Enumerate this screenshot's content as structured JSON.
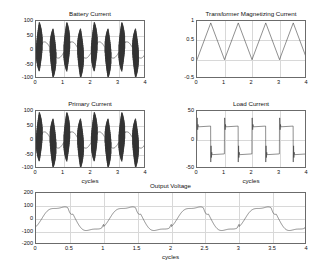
{
  "figure": {
    "background": "#ffffff",
    "line_color": "#333333",
    "grid_color": "#d8d8d8",
    "axis_color": "#6b6b6b"
  },
  "chart_data": [
    {
      "id": "battery-current",
      "type": "line",
      "title": "Battery Current",
      "xlabel": "",
      "ylabel": "",
      "xlim": [
        0,
        4
      ],
      "ylim": [
        -100,
        100
      ],
      "xticks": [
        0,
        1,
        2,
        3,
        4
      ],
      "xticklabels": [
        "0",
        "1",
        "2",
        "3",
        "4"
      ],
      "yticks": [
        -100,
        -50,
        0,
        50,
        100
      ],
      "yticklabels": [
        "-100",
        "-50",
        "0",
        "50",
        "100"
      ],
      "grid": true,
      "description": "High-frequency switching current bursts riding on a slow sinusoidal envelope; eight spike clusters across 4 cycles, spikes reach about +95 and -95.",
      "envelope_period_cycles": 0.5,
      "spike_peak": 95,
      "spike_min": -95,
      "series": [
        {
          "name": "Battery Current",
          "envelope_amplitude": 28,
          "burst_centers": [
            0.12,
            0.62,
            1.12,
            1.62,
            2.12,
            2.62,
            3.12,
            3.62
          ]
        }
      ]
    },
    {
      "id": "transformer-magnetizing-current",
      "type": "line",
      "title": "Transformer Magnetizing Current",
      "xlabel": "",
      "ylabel": "",
      "xlim": [
        0,
        4
      ],
      "ylim": [
        -0.5,
        1
      ],
      "xticks": [
        0,
        1,
        2,
        3,
        4
      ],
      "xticklabels": [
        "0",
        "1",
        "2",
        "3",
        "4"
      ],
      "yticks": [
        -0.5,
        0,
        0.5,
        1
      ],
      "yticklabels": [
        "-0.5",
        "0",
        "0.5",
        "1"
      ],
      "grid": true,
      "description": "Triangular magnetizing current ramping from 0 up to about 0.95 at each half cycle then back to 0; period of 1 cycle with peaks at 0.5, 1.5, 2.5, 3.5.",
      "series": [
        {
          "name": "Transformer Magnetizing Current",
          "peak": 0.95,
          "trough": 0.0,
          "peak_positions": [
            0.5,
            1.5,
            2.5,
            3.5
          ],
          "trough_positions": [
            0,
            1,
            2,
            3,
            4
          ]
        }
      ]
    },
    {
      "id": "primary-current",
      "type": "line",
      "title": "Primary Current",
      "xlabel": "cycles",
      "ylabel": "",
      "xlim": [
        0,
        4
      ],
      "ylim": [
        -100,
        100
      ],
      "xticks": [
        0,
        1,
        2,
        3,
        4
      ],
      "xticklabels": [
        "0",
        "1",
        "2",
        "3",
        "4"
      ],
      "yticks": [
        -100,
        -50,
        0,
        50,
        100
      ],
      "yticklabels": [
        "-100",
        "-50",
        "0",
        "50",
        "100"
      ],
      "grid": true,
      "description": "Primary winding current nearly identical to battery current: high-frequency spike bursts with slow sinusoidal envelope, spikes to about +95 and -95.",
      "series": [
        {
          "name": "Primary Current",
          "envelope_amplitude": 28,
          "spike_peak": 95,
          "spike_min": -95,
          "burst_centers": [
            0.12,
            0.62,
            1.12,
            1.62,
            2.12,
            2.62,
            3.12,
            3.62
          ]
        }
      ]
    },
    {
      "id": "load-current",
      "type": "line",
      "title": "Load Current",
      "xlabel": "cycles",
      "ylabel": "",
      "xlim": [
        0,
        4
      ],
      "ylim": [
        -50,
        50
      ],
      "xticks": [
        0,
        1,
        2,
        3,
        4
      ],
      "xticklabels": [
        "0",
        "1",
        "2",
        "3",
        "4"
      ],
      "yticks": [
        -50,
        0,
        50
      ],
      "yticklabels": [
        "-50",
        "0",
        "50"
      ],
      "grid": true,
      "description": "Square-wave load current alternating between about +24 and -24 every half cycle, with damped ringing overshoot spikes at each transition.",
      "series": [
        {
          "name": "Load Current",
          "high_level": 24,
          "low_level": -24,
          "half_period_cycles": 0.5,
          "ringing_overshoot": 14
        }
      ]
    },
    {
      "id": "output-voltage",
      "type": "line",
      "title": "Output Voltage",
      "xlabel": "cycles",
      "ylabel": "",
      "xlim": [
        0,
        4
      ],
      "ylim": [
        -200,
        200
      ],
      "xticks": [
        0,
        0.5,
        1,
        1.5,
        2,
        2.5,
        3,
        3.5,
        4
      ],
      "xticklabels": [
        "0",
        "0.5",
        "1",
        "1.5",
        "2",
        "2.5",
        "3",
        "3.5",
        "4"
      ],
      "yticks": [
        -200,
        -100,
        0,
        100,
        200
      ],
      "yticklabels": [
        "-200",
        "-100",
        "0",
        "100",
        "200"
      ],
      "grid": true,
      "description": "Distorted quasi-sinusoidal output voltage, peak about +110 near 0.40 cycles and trough about -105 near 0.92 cycles, repeating each cycle with a sharp notch just after each peak.",
      "series": [
        {
          "name": "Output Voltage",
          "peak": 110,
          "trough": -105,
          "period_cycles": 1.0,
          "peak_positions": [
            0.42,
            1.42,
            2.42,
            3.42
          ],
          "trough_positions": [
            0.92,
            1.92,
            2.92,
            3.92
          ]
        }
      ]
    }
  ]
}
